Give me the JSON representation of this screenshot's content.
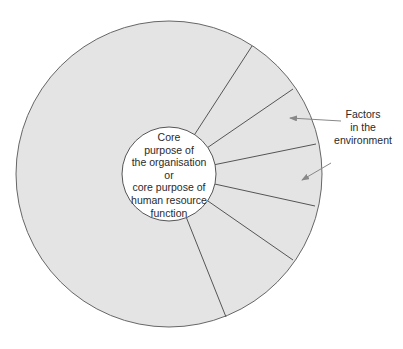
{
  "diagram": {
    "type": "segmented-circle",
    "outer_circle": {
      "cx": 169,
      "cy": 174,
      "r": 153,
      "fill": "#e4e4e4",
      "stroke": "#666666"
    },
    "inner_circle": {
      "cx": 169,
      "cy": 174,
      "r": 47,
      "fill": "#ffffff",
      "stroke": "#555555"
    },
    "core": {
      "lines": [
        "Core",
        "purpose of",
        "the organisation",
        "or",
        "core purpose of",
        "human resource",
        "function"
      ]
    },
    "factors": {
      "lines": [
        "Factors",
        "in the",
        "environment"
      ]
    },
    "segment_lines": [
      {
        "x2": 252,
        "y2": 46
      },
      {
        "x2": 293,
        "y2": 89
      },
      {
        "x2": 316,
        "y2": 144
      },
      {
        "x2": 315,
        "y2": 206
      },
      {
        "x2": 293,
        "y2": 260
      },
      {
        "x2": 226,
        "y2": 317
      }
    ],
    "arrows": [
      {
        "x1": 341,
        "y1": 121,
        "x2": 290,
        "y2": 118
      },
      {
        "x1": 331,
        "y1": 163,
        "x2": 302,
        "y2": 180
      }
    ],
    "colors": {
      "fill": "#e4e4e4",
      "line": "#555555",
      "arrow": "#888888",
      "text": "#2a2a2a"
    }
  }
}
